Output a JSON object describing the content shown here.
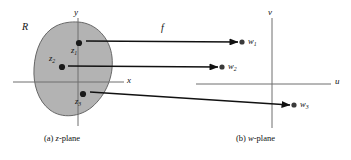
{
  "figure": {
    "region_label": "R",
    "map_label": "f",
    "zplane": {
      "caption_prefix": "(a) ",
      "caption_name": "z",
      "caption_suffix": "-plane",
      "caption_full": "(a) z-plane",
      "axes": [
        {
          "name": "x-axis",
          "label": "x",
          "label_x": 127,
          "label_y": 78
        },
        {
          "name": "y-axis",
          "label": "y",
          "label_x": 74,
          "label_y": 10
        }
      ],
      "points": [
        {
          "name": "z1",
          "base": "z",
          "sub": "1",
          "cx": 79,
          "cy": 43,
          "label_x": 71,
          "label_y": 47
        },
        {
          "name": "z2",
          "base": "z",
          "sub": "2",
          "cx": 62,
          "cy": 67,
          "label_x": 50,
          "label_y": 55
        },
        {
          "name": "z3",
          "base": "z",
          "sub": "3",
          "cx": 83,
          "cy": 94,
          "label_x": 75,
          "label_y": 98
        }
      ]
    },
    "wplane": {
      "caption_prefix": "(b) ",
      "caption_name": "w",
      "caption_suffix": "-plane",
      "caption_full": "(b) w-plane",
      "axes": [
        {
          "name": "u-axis",
          "label": "u",
          "label_x": 335,
          "label_y": 79
        },
        {
          "name": "v-axis",
          "label": "v",
          "label_x": 268,
          "label_y": 10
        }
      ],
      "points": [
        {
          "name": "w1",
          "base": "w",
          "sub": "1",
          "cx": 242,
          "cy": 42,
          "label_x": 248,
          "label_y": 38
        },
        {
          "name": "w2",
          "base": "w",
          "sub": "2",
          "cx": 222,
          "cy": 67,
          "label_x": 228,
          "label_y": 62
        },
        {
          "name": "w3",
          "base": "w",
          "sub": "3",
          "cx": 294,
          "cy": 105,
          "label_x": 300,
          "label_y": 100
        }
      ]
    },
    "colors": {
      "region_fill": "#b3b3b3",
      "region_stroke": "#5a5a5a",
      "axis_stroke": "#6e6e6e",
      "arrow_stroke": "#111111",
      "point_fill": "#1a1a1a",
      "background": "#ffffff"
    }
  }
}
